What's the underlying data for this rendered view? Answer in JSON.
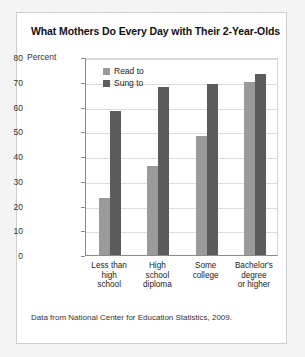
{
  "chart_data": {
    "type": "bar",
    "title": "What Mothers Do Every Day with Their 2-Year-Olds",
    "xlabel": "",
    "ylabel": "Percent",
    "ylim": [
      0,
      80
    ],
    "yticks": [
      0,
      10,
      20,
      30,
      40,
      50,
      60,
      70,
      80
    ],
    "grid": true,
    "legend_position": "top-left-inside",
    "categories": [
      "Less than high school",
      "High school diploma",
      "Some college",
      "Bachelor's degree or higher"
    ],
    "category_lines": [
      [
        "Less than",
        "high",
        "school"
      ],
      [
        "High",
        "school",
        "diploma"
      ],
      [
        "Some",
        "college"
      ],
      [
        "Bachelor's",
        "degree",
        "or higher"
      ]
    ],
    "series": [
      {
        "name": "Read to",
        "color": "#9a9a9a",
        "values": [
          23,
          36,
          48,
          70
        ]
      },
      {
        "name": "Sung to",
        "color": "#5c5c5c",
        "values": [
          58,
          68,
          69,
          73
        ]
      }
    ],
    "source": "Data from National Center for Education Statistics, 2009."
  }
}
